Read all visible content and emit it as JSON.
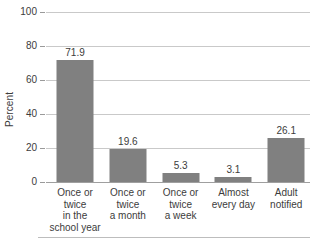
{
  "chart_data": {
    "type": "bar",
    "title": "",
    "subtitle": "",
    "xlabel": "",
    "ylabel": "Percent",
    "ylim": [
      0,
      100
    ],
    "yticks": [
      0,
      20,
      40,
      60,
      80,
      100
    ],
    "ytick_labels": [
      "0",
      "20",
      "40",
      "60",
      "80",
      "100"
    ],
    "grid": true,
    "legend": false,
    "legend_position": "none",
    "bar_color": "#808080",
    "gridline_color": "#c9c9c9",
    "axis_color": "#9f9f9f",
    "text_color": "#3c3c3c",
    "categories": [
      "Once or\ntwice\nin the\nschool year",
      "Once or\ntwice\na month",
      "Once or\ntwice\na week",
      "Almost\nevery day",
      "Adult\nnotified"
    ],
    "values": [
      71.9,
      19.6,
      5.3,
      3.1,
      26.1
    ],
    "value_labels": [
      "71.9",
      "19.6",
      "5.3",
      "3.1",
      "26.1"
    ],
    "bar_positions_pct": [
      11.0,
      31.0,
      51.0,
      71.0,
      91.0
    ]
  }
}
